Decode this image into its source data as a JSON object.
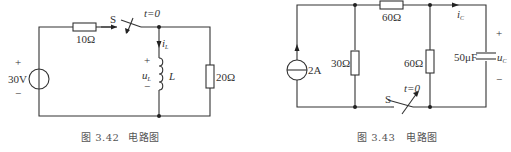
{
  "figures": [
    {
      "id": "fig-3-42",
      "caption_number": "图 3.42",
      "caption_title": "电路图",
      "components": {
        "voltage_source": {
          "value": "30V",
          "plus": "+",
          "minus": "−"
        },
        "series_resistor": {
          "value": "10Ω"
        },
        "switch": {
          "label": "S",
          "time": "t=0"
        },
        "inductor": {
          "label": "L",
          "current": "i",
          "current_sub": "L",
          "voltage": "u",
          "voltage_sub": "L",
          "plus": "+",
          "minus": "−"
        },
        "load_resistor": {
          "value": "20Ω"
        }
      }
    },
    {
      "id": "fig-3-43",
      "caption_number": "图 3.43",
      "caption_title": "电路图",
      "components": {
        "current_source": {
          "value": "2A"
        },
        "shunt_resistor_1": {
          "value": "30Ω"
        },
        "series_resistor": {
          "value": "60Ω"
        },
        "shunt_resistor_2": {
          "value": "60Ω"
        },
        "capacitor": {
          "value": "50μF",
          "voltage": "u",
          "voltage_sub": "C",
          "current": "i",
          "current_sub": "C",
          "plus": "+",
          "minus": "−"
        },
        "switch": {
          "label": "S",
          "time": "t=0"
        }
      }
    }
  ]
}
